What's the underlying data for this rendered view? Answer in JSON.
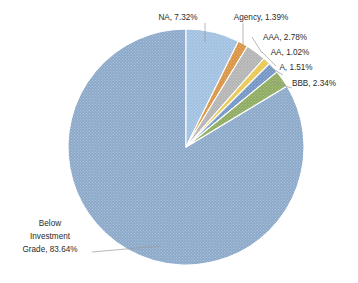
{
  "chart_data": {
    "type": "pie",
    "title": "",
    "subtitle": "",
    "xlabel": "",
    "ylabel": "",
    "legend_position": "none",
    "grid": false,
    "label_format": "name, percent",
    "start_angle_deg": 0,
    "direction": "clockwise",
    "categories": [
      "NA",
      "Agency",
      "AAA",
      "AA",
      "A",
      "BBB",
      "Below Investment Grade"
    ],
    "values": [
      7.32,
      1.39,
      2.78,
      1.02,
      1.51,
      2.34,
      83.64
    ],
    "slices": [
      {
        "name": "NA",
        "percent": 7.32,
        "label": "NA, 7.32%",
        "color": "#9ebfe0",
        "edge_color": "#ffffff",
        "label_lines": [
          "NA, 7.32%"
        ]
      },
      {
        "name": "Agency",
        "percent": 1.39,
        "label": "Agency, 1.39%",
        "color": "#d8913f",
        "edge_color": "#ffffff",
        "label_lines": [
          "Agency, 1.39%"
        ]
      },
      {
        "name": "AAA",
        "percent": 2.78,
        "label": "AAA, 2.78%",
        "color": "#b2b2b2",
        "edge_color": "#ffffff",
        "label_lines": [
          "AAA, 2.78%"
        ]
      },
      {
        "name": "AA",
        "percent": 1.02,
        "label": "AA, 1.02%",
        "color": "#e8c64d",
        "edge_color": "#ffffff",
        "label_lines": [
          "AA, 1.02%"
        ]
      },
      {
        "name": "A",
        "percent": 1.51,
        "label": "A, 1.51%",
        "color": "#6f93c4",
        "edge_color": "#ffffff",
        "label_lines": [
          "A, 1.51%"
        ]
      },
      {
        "name": "BBB",
        "percent": 2.34,
        "label": "BBB, 2.34%",
        "color": "#8aa95c",
        "edge_color": "#ffffff",
        "label_lines": [
          "BBB, 2.34%"
        ]
      },
      {
        "name": "Below Investment Grade",
        "percent": 83.64,
        "label": "Below Investment Grade, 83.64%",
        "color": "#89a7c8",
        "edge_color": "#ffffff",
        "label_lines": [
          "Below",
          "Investment",
          "Grade, 83.64%"
        ]
      }
    ],
    "label_text_color": "#2b2b2b",
    "leader_line_color": "#9a9a9a",
    "background_color": "#ffffff"
  },
  "labels": {
    "na": "NA, 7.32%",
    "agency": "Agency, 1.39%",
    "aaa": "AAA, 2.78%",
    "aa": "AA, 1.02%",
    "a": "A, 1.51%",
    "bbb": "BBB, 2.34%",
    "big_line1": "Below",
    "big_line2": "Investment",
    "big_line3": "Grade, 83.64%"
  }
}
